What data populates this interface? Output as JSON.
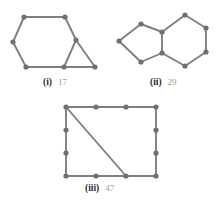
{
  "figure": {
    "background_color": "#ffffff",
    "edge_color": "#7f7f7f",
    "vertex_color": "#707070",
    "label_color": "#2b2b2b",
    "number_color": "#9a9a9a",
    "edge_width": 1.9,
    "vertex_radius": 2.6
  },
  "panels": [
    {
      "id": "panel-i",
      "caption_roman": "(i)",
      "caption_number": "17",
      "description": "Hexagon with an attached triangle on the right",
      "vertices": [
        {
          "name": "i-v1",
          "x": 24,
          "y": 17
        },
        {
          "name": "i-v2",
          "x": 65,
          "y": 17
        },
        {
          "name": "i-v3",
          "x": 76,
          "y": 40
        },
        {
          "name": "i-v4",
          "x": 64,
          "y": 67
        },
        {
          "name": "i-v5",
          "x": 26,
          "y": 67
        },
        {
          "name": "i-v6",
          "x": 13,
          "y": 42
        },
        {
          "name": "i-v7",
          "x": 95,
          "y": 67
        }
      ],
      "edges": [
        [
          0,
          1
        ],
        [
          1,
          2
        ],
        [
          2,
          3
        ],
        [
          3,
          4
        ],
        [
          4,
          5
        ],
        [
          5,
          0
        ],
        [
          2,
          6
        ],
        [
          3,
          6
        ]
      ],
      "vertex_count": 7,
      "edge_count": 8
    },
    {
      "id": "panel-ii",
      "caption_roman": "(ii)",
      "caption_number": "29",
      "description": "Pentagon fused with a hexagon sharing a vertical edge",
      "vertices": [
        {
          "name": "ii-v1",
          "x": 119,
          "y": 41
        },
        {
          "name": "ii-v2",
          "x": 141,
          "y": 24
        },
        {
          "name": "ii-v3",
          "x": 162,
          "y": 32
        },
        {
          "name": "ii-v4",
          "x": 162,
          "y": 53
        },
        {
          "name": "ii-v5",
          "x": 141,
          "y": 62
        },
        {
          "name": "ii-v6",
          "x": 185,
          "y": 15
        },
        {
          "name": "ii-v7",
          "x": 206,
          "y": 28
        },
        {
          "name": "ii-v8",
          "x": 206,
          "y": 52
        },
        {
          "name": "ii-v9",
          "x": 185,
          "y": 66
        }
      ],
      "edges": [
        [
          0,
          1
        ],
        [
          1,
          2
        ],
        [
          2,
          3
        ],
        [
          3,
          4
        ],
        [
          4,
          0
        ],
        [
          2,
          5
        ],
        [
          5,
          6
        ],
        [
          6,
          7
        ],
        [
          7,
          8
        ],
        [
          8,
          3
        ]
      ],
      "vertex_count": 9,
      "edge_count": 10
    },
    {
      "id": "panel-iii",
      "caption_roman": "(iii)",
      "caption_number": "47",
      "description": "Rectangle with subdivided sides and one diagonal",
      "vertices": [
        {
          "name": "iii-t1",
          "x": 66,
          "y": 107
        },
        {
          "name": "iii-t2",
          "x": 96,
          "y": 107
        },
        {
          "name": "iii-t3",
          "x": 126,
          "y": 107
        },
        {
          "name": "iii-t4",
          "x": 156,
          "y": 107
        },
        {
          "name": "iii-r2",
          "x": 156,
          "y": 130
        },
        {
          "name": "iii-r3",
          "x": 156,
          "y": 153
        },
        {
          "name": "iii-b4",
          "x": 156,
          "y": 176
        },
        {
          "name": "iii-b3",
          "x": 126,
          "y": 176
        },
        {
          "name": "iii-b2",
          "x": 96,
          "y": 176
        },
        {
          "name": "iii-b1",
          "x": 66,
          "y": 176
        },
        {
          "name": "iii-l3",
          "x": 66,
          "y": 153
        },
        {
          "name": "iii-l2",
          "x": 66,
          "y": 130
        }
      ],
      "edges": [
        [
          0,
          1
        ],
        [
          1,
          2
        ],
        [
          2,
          3
        ],
        [
          3,
          4
        ],
        [
          4,
          5
        ],
        [
          5,
          6
        ],
        [
          6,
          7
        ],
        [
          7,
          8
        ],
        [
          8,
          9
        ],
        [
          9,
          10
        ],
        [
          10,
          11
        ],
        [
          11,
          0
        ],
        [
          0,
          7
        ]
      ],
      "vertex_count": 12,
      "edge_count": 13
    }
  ]
}
